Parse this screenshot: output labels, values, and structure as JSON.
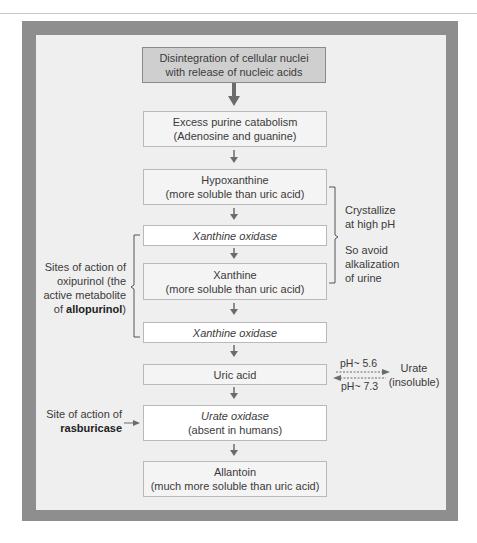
{
  "diagram": {
    "nodes": [
      {
        "id": "top",
        "line1": "Disintegration of cellular nuclei",
        "line2": "with release of nucleic acids"
      },
      {
        "id": "purine",
        "line1": "Excess purine catabolism",
        "line2": "(Adenosine and guanine)"
      },
      {
        "id": "hypoxanthine",
        "line1": "Hypoxanthine",
        "line2": "(more soluble than uric acid)"
      },
      {
        "id": "xo1",
        "line1": "Xanthine oxidase"
      },
      {
        "id": "xanthine",
        "line1": "Xanthine",
        "line2": "(more soluble than uric acid)"
      },
      {
        "id": "xo2",
        "line1": "Xanthine oxidase"
      },
      {
        "id": "uric",
        "line1": "Uric acid"
      },
      {
        "id": "urateox",
        "line1": "Urate oxidase",
        "line2": "(absent in humans)"
      },
      {
        "id": "allantoin",
        "line1": "Allantoin",
        "line2": "(much more soluble than uric acid)"
      }
    ],
    "right_note": {
      "line1": "Crystallize",
      "line2": "at high pH",
      "line3": "So avoid",
      "line4": "alkalization",
      "line5": "of urine"
    },
    "left_note": {
      "line1": "Sites of action of",
      "line2": "oxipurinol (the",
      "line3": "active metabolite",
      "line4_prefix": "of ",
      "line4_bold": "allopurinol",
      ")": ")"
    },
    "ph_note": {
      "forward": "pH~ 5.6",
      "reverse": "pH~ 7.3",
      "target_line1": "Urate",
      "target_line2": "(insoluble)"
    },
    "rasburicase_note": {
      "line1": "Site of action of",
      "line2_bold": "rasburicase"
    },
    "colors": {
      "frame": "#8e8e8e",
      "inner": "#efefef",
      "top_box": "#cfcfcf",
      "arrow": "#6b6b6b"
    }
  }
}
